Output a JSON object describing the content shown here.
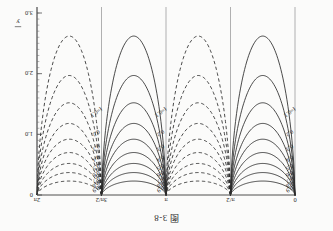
{
  "figure": {
    "caption": "图 3-8",
    "xaxis": {
      "label": "x",
      "label_overbar": true,
      "ticks": [
        {
          "value": 0,
          "text": "0"
        },
        {
          "value": 1.5708,
          "text": "π/2"
        },
        {
          "value": 3.1416,
          "text": "π"
        },
        {
          "value": 4.7124,
          "text": "3π/2"
        },
        {
          "value": 6.2832,
          "text": "2π"
        }
      ],
      "range": [
        0,
        6.2832
      ]
    },
    "yaxis": {
      "label": "y",
      "label_overbar": true,
      "ticks": [
        {
          "value": 0.0,
          "text": "0"
        },
        {
          "value": 1.0,
          "text": "1.0"
        },
        {
          "value": 2.0,
          "text": "2.0"
        },
        {
          "value": 3.0,
          "text": "3.0"
        }
      ],
      "range": [
        0,
        3.0
      ],
      "minor_tick_step": 0.1
    },
    "contour_label_prefix": "f=",
    "contour_labels": [
      "0.9",
      "0.8",
      "0.7",
      "0.6",
      "0.5",
      "0.4",
      "0.3",
      "0.2",
      "f=0.1"
    ],
    "ink_color": "#2a2a2a",
    "grid_color": "#8f8f8f"
  },
  "chart_data": {
    "type": "line",
    "title": "图 3-8",
    "xlabel": "x",
    "ylabel": "y",
    "xlim": [
      0,
      6.2832
    ],
    "ylim": [
      0,
      3.0
    ],
    "xticks": [
      0,
      1.5708,
      3.1416,
      4.7124,
      6.2832
    ],
    "xticklabels": [
      "0",
      "π/2",
      "π",
      "3π/2",
      "2π"
    ],
    "yticks": [
      0,
      1.0,
      2.0,
      3.0
    ],
    "yticklabels": [
      "0",
      "1.0",
      "2.0",
      "3.0"
    ],
    "grid": true,
    "legend": "none",
    "annotations": [
      "f=0.1",
      "f=0.1",
      "f=0.1"
    ],
    "series": [
      {
        "name": "f=0.9",
        "level": 0.9,
        "style": "solid",
        "lobe": 1,
        "depth": 0.23,
        "label": "0.9"
      },
      {
        "name": "f=0.8",
        "level": 0.8,
        "style": "solid",
        "lobe": 1,
        "depth": 0.37,
        "label": "0.8"
      },
      {
        "name": "f=0.7",
        "level": 0.7,
        "style": "solid",
        "lobe": 1,
        "depth": 0.52,
        "label": "0.7"
      },
      {
        "name": "f=0.6",
        "level": 0.6,
        "style": "solid",
        "lobe": 1,
        "depth": 0.7,
        "label": "0.6"
      },
      {
        "name": "f=0.5",
        "level": 0.5,
        "style": "solid",
        "lobe": 1,
        "depth": 0.92,
        "label": "0.5"
      },
      {
        "name": "f=0.4",
        "level": 0.4,
        "style": "solid",
        "lobe": 1,
        "depth": 1.18,
        "label": "0.4"
      },
      {
        "name": "f=0.3",
        "level": 0.3,
        "style": "solid",
        "lobe": 1,
        "depth": 1.52,
        "label": "0.3"
      },
      {
        "name": "f=0.2",
        "level": 0.2,
        "style": "solid",
        "lobe": 1,
        "depth": 1.97,
        "label": "0.2"
      },
      {
        "name": "f=0.1",
        "level": 0.1,
        "style": "solid",
        "lobe": 1,
        "depth": 2.62,
        "label": "f=0.1"
      },
      {
        "name": "f=0.9",
        "level": 0.9,
        "style": "dashed",
        "lobe": 2,
        "depth": 0.23,
        "label": ""
      },
      {
        "name": "f=0.8",
        "level": 0.8,
        "style": "dashed",
        "lobe": 2,
        "depth": 0.37,
        "label": ""
      },
      {
        "name": "f=0.7",
        "level": 0.7,
        "style": "dashed",
        "lobe": 2,
        "depth": 0.52,
        "label": ""
      },
      {
        "name": "f=0.6",
        "level": 0.6,
        "style": "dashed",
        "lobe": 2,
        "depth": 0.7,
        "label": ""
      },
      {
        "name": "f=0.5",
        "level": 0.5,
        "style": "dashed",
        "lobe": 2,
        "depth": 0.92,
        "label": ""
      },
      {
        "name": "f=0.4",
        "level": 0.4,
        "style": "dashed",
        "lobe": 2,
        "depth": 1.18,
        "label": ""
      },
      {
        "name": "f=0.3",
        "level": 0.3,
        "style": "dashed",
        "lobe": 2,
        "depth": 1.52,
        "label": ""
      },
      {
        "name": "f=0.2",
        "level": 0.2,
        "style": "dashed",
        "lobe": 2,
        "depth": 1.97,
        "label": ""
      },
      {
        "name": "f=0.1",
        "level": 0.1,
        "style": "dashed",
        "lobe": 2,
        "depth": 2.62,
        "label": ""
      },
      {
        "name": "f=0.9",
        "level": 0.9,
        "style": "solid",
        "lobe": 3,
        "depth": 0.23,
        "label": "0.9"
      },
      {
        "name": "f=0.8",
        "level": 0.8,
        "style": "solid",
        "lobe": 3,
        "depth": 0.37,
        "label": "0.8"
      },
      {
        "name": "f=0.7",
        "level": 0.7,
        "style": "solid",
        "lobe": 3,
        "depth": 0.52,
        "label": "0.7"
      },
      {
        "name": "f=0.6",
        "level": 0.6,
        "style": "solid",
        "lobe": 3,
        "depth": 0.7,
        "label": "0.6"
      },
      {
        "name": "f=0.5",
        "level": 0.5,
        "style": "solid",
        "lobe": 3,
        "depth": 0.92,
        "label": "0.5"
      },
      {
        "name": "f=0.4",
        "level": 0.4,
        "style": "solid",
        "lobe": 3,
        "depth": 1.18,
        "label": "0.4"
      },
      {
        "name": "f=0.3",
        "level": 0.3,
        "style": "solid",
        "lobe": 3,
        "depth": 1.52,
        "label": "0.3"
      },
      {
        "name": "f=0.2",
        "level": 0.2,
        "style": "solid",
        "lobe": 3,
        "depth": 1.97,
        "label": "0.2"
      },
      {
        "name": "f=0.1",
        "level": 0.1,
        "style": "solid",
        "lobe": 3,
        "depth": 2.62,
        "label": "f=0.1"
      },
      {
        "name": "f=0.9",
        "level": 0.9,
        "style": "dashed",
        "lobe": 4,
        "depth": 0.23,
        "label": "0.9"
      },
      {
        "name": "f=0.8",
        "level": 0.8,
        "style": "dashed",
        "lobe": 4,
        "depth": 0.37,
        "label": "0.8"
      },
      {
        "name": "f=0.7",
        "level": 0.7,
        "style": "dashed",
        "lobe": 4,
        "depth": 0.52,
        "label": "0.7"
      },
      {
        "name": "f=0.6",
        "level": 0.6,
        "style": "dashed",
        "lobe": 4,
        "depth": 0.7,
        "label": "0.6"
      },
      {
        "name": "f=0.5",
        "level": 0.5,
        "style": "dashed",
        "lobe": 4,
        "depth": 0.92,
        "label": "0.5"
      },
      {
        "name": "f=0.4",
        "level": 0.4,
        "style": "dashed",
        "lobe": 4,
        "depth": 1.18,
        "label": "0.4"
      },
      {
        "name": "f=0.3",
        "level": 0.3,
        "style": "dashed",
        "lobe": 4,
        "depth": 1.52,
        "label": "0.3"
      },
      {
        "name": "f=0.2",
        "level": 0.2,
        "style": "dashed",
        "lobe": 4,
        "depth": 1.97,
        "label": "0.2"
      },
      {
        "name": "f=0.1",
        "level": 0.1,
        "style": "dashed",
        "lobe": 4,
        "depth": 2.62,
        "label": "f=0.1"
      }
    ]
  }
}
